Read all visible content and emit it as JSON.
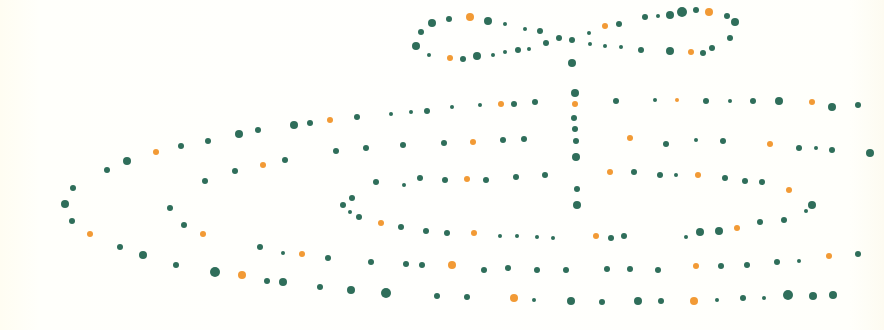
{
  "illustration": {
    "subject": "gift box drawn with dots",
    "background": "#fffef9",
    "colors": {
      "green": "#2f6e5a",
      "orange": "#f29a35"
    },
    "dots": [
      [
        470,
        17,
        4,
        "o"
      ],
      [
        449,
        19,
        3,
        "g"
      ],
      [
        432,
        23,
        4,
        "g"
      ],
      [
        421,
        32,
        3,
        "g"
      ],
      [
        416,
        46,
        4,
        "g"
      ],
      [
        429,
        55,
        2,
        "g"
      ],
      [
        450,
        58,
        3,
        "o"
      ],
      [
        463,
        59,
        3,
        "g"
      ],
      [
        477,
        56,
        4,
        "g"
      ],
      [
        493,
        55,
        2,
        "g"
      ],
      [
        505,
        52,
        2,
        "g"
      ],
      [
        518,
        50,
        3,
        "g"
      ],
      [
        529,
        49,
        2,
        "g"
      ],
      [
        488,
        21,
        4,
        "g"
      ],
      [
        505,
        24,
        2,
        "g"
      ],
      [
        525,
        29,
        2,
        "g"
      ],
      [
        540,
        31,
        3,
        "g"
      ],
      [
        546,
        43,
        3,
        "g"
      ],
      [
        559,
        38,
        3,
        "g"
      ],
      [
        572,
        40,
        3,
        "g"
      ],
      [
        572,
        63,
        4,
        "g"
      ],
      [
        590,
        44,
        2,
        "g"
      ],
      [
        605,
        46,
        2,
        "g"
      ],
      [
        621,
        47,
        2,
        "g"
      ],
      [
        641,
        50,
        3,
        "g"
      ],
      [
        670,
        51,
        4,
        "g"
      ],
      [
        691,
        52,
        3,
        "o"
      ],
      [
        703,
        53,
        3,
        "g"
      ],
      [
        712,
        48,
        3,
        "g"
      ],
      [
        730,
        38,
        3,
        "g"
      ],
      [
        735,
        22,
        4,
        "g"
      ],
      [
        727,
        16,
        3,
        "g"
      ],
      [
        709,
        12,
        4,
        "o"
      ],
      [
        696,
        10,
        3,
        "g"
      ],
      [
        682,
        12,
        5,
        "g"
      ],
      [
        670,
        15,
        4,
        "g"
      ],
      [
        658,
        16,
        2,
        "g"
      ],
      [
        645,
        17,
        3,
        "g"
      ],
      [
        619,
        24,
        3,
        "g"
      ],
      [
        605,
        26,
        3,
        "o"
      ],
      [
        589,
        33,
        2,
        "g"
      ],
      [
        73,
        188,
        3,
        "g"
      ],
      [
        65,
        204,
        4,
        "g"
      ],
      [
        72,
        221,
        3,
        "g"
      ],
      [
        90,
        234,
        3,
        "o"
      ],
      [
        107,
        170,
        3,
        "g"
      ],
      [
        127,
        161,
        4,
        "g"
      ],
      [
        156,
        152,
        3,
        "o"
      ],
      [
        181,
        146,
        3,
        "g"
      ],
      [
        208,
        141,
        3,
        "g"
      ],
      [
        239,
        134,
        4,
        "g"
      ],
      [
        258,
        130,
        3,
        "g"
      ],
      [
        294,
        125,
        4,
        "g"
      ],
      [
        310,
        123,
        3,
        "g"
      ],
      [
        330,
        120,
        3,
        "o"
      ],
      [
        357,
        117,
        3,
        "g"
      ],
      [
        391,
        114,
        2,
        "g"
      ],
      [
        411,
        112,
        2,
        "g"
      ],
      [
        427,
        111,
        3,
        "g"
      ],
      [
        452,
        107,
        2,
        "g"
      ],
      [
        480,
        105,
        2,
        "g"
      ],
      [
        501,
        104,
        3,
        "o"
      ],
      [
        514,
        104,
        3,
        "g"
      ],
      [
        535,
        102,
        3,
        "g"
      ],
      [
        120,
        247,
        3,
        "g"
      ],
      [
        143,
        255,
        4,
        "g"
      ],
      [
        176,
        265,
        3,
        "g"
      ],
      [
        215,
        272,
        5,
        "g"
      ],
      [
        242,
        275,
        4,
        "o"
      ],
      [
        267,
        281,
        3,
        "g"
      ],
      [
        283,
        282,
        4,
        "g"
      ],
      [
        320,
        287,
        3,
        "g"
      ],
      [
        351,
        290,
        4,
        "g"
      ],
      [
        386,
        293,
        5,
        "g"
      ],
      [
        437,
        296,
        3,
        "g"
      ],
      [
        467,
        297,
        3,
        "g"
      ],
      [
        514,
        298,
        4,
        "o"
      ],
      [
        534,
        300,
        2,
        "g"
      ],
      [
        571,
        301,
        4,
        "g"
      ],
      [
        602,
        302,
        3,
        "g"
      ],
      [
        638,
        301,
        4,
        "g"
      ],
      [
        661,
        301,
        3,
        "g"
      ],
      [
        694,
        301,
        4,
        "o"
      ],
      [
        717,
        300,
        2,
        "g"
      ],
      [
        743,
        298,
        3,
        "g"
      ],
      [
        764,
        298,
        2,
        "g"
      ],
      [
        788,
        295,
        5,
        "g"
      ],
      [
        813,
        296,
        4,
        "g"
      ],
      [
        833,
        295,
        4,
        "g"
      ],
      [
        170,
        208,
        3,
        "g"
      ],
      [
        184,
        225,
        3,
        "g"
      ],
      [
        203,
        234,
        3,
        "o"
      ],
      [
        205,
        181,
        3,
        "g"
      ],
      [
        235,
        171,
        3,
        "g"
      ],
      [
        263,
        165,
        3,
        "o"
      ],
      [
        285,
        160,
        3,
        "g"
      ],
      [
        336,
        151,
        3,
        "g"
      ],
      [
        366,
        148,
        3,
        "g"
      ],
      [
        403,
        145,
        3,
        "g"
      ],
      [
        444,
        143,
        3,
        "g"
      ],
      [
        473,
        142,
        3,
        "o"
      ],
      [
        503,
        140,
        3,
        "g"
      ],
      [
        524,
        139,
        3,
        "g"
      ],
      [
        260,
        247,
        3,
        "g"
      ],
      [
        283,
        253,
        2,
        "g"
      ],
      [
        302,
        254,
        3,
        "o"
      ],
      [
        328,
        258,
        3,
        "g"
      ],
      [
        371,
        262,
        3,
        "g"
      ],
      [
        406,
        264,
        3,
        "g"
      ],
      [
        422,
        265,
        3,
        "g"
      ],
      [
        452,
        265,
        4,
        "o"
      ],
      [
        484,
        270,
        3,
        "g"
      ],
      [
        508,
        268,
        3,
        "g"
      ],
      [
        537,
        270,
        3,
        "g"
      ],
      [
        566,
        270,
        3,
        "g"
      ],
      [
        607,
        269,
        3,
        "g"
      ],
      [
        630,
        269,
        3,
        "g"
      ],
      [
        658,
        270,
        3,
        "g"
      ],
      [
        696,
        266,
        3,
        "o"
      ],
      [
        721,
        266,
        3,
        "g"
      ],
      [
        747,
        265,
        3,
        "g"
      ],
      [
        777,
        262,
        3,
        "g"
      ],
      [
        799,
        261,
        2,
        "g"
      ],
      [
        829,
        256,
        3,
        "o"
      ],
      [
        858,
        254,
        3,
        "g"
      ],
      [
        343,
        205,
        3,
        "g"
      ],
      [
        352,
        198,
        3,
        "g"
      ],
      [
        350,
        212,
        2,
        "g"
      ],
      [
        359,
        217,
        3,
        "g"
      ],
      [
        381,
        223,
        3,
        "o"
      ],
      [
        401,
        227,
        3,
        "g"
      ],
      [
        426,
        231,
        3,
        "g"
      ],
      [
        447,
        233,
        3,
        "g"
      ],
      [
        474,
        233,
        3,
        "o"
      ],
      [
        500,
        236,
        2,
        "g"
      ],
      [
        517,
        236,
        2,
        "g"
      ],
      [
        537,
        237,
        2,
        "g"
      ],
      [
        553,
        238,
        2,
        "g"
      ],
      [
        596,
        236,
        3,
        "o"
      ],
      [
        611,
        238,
        3,
        "g"
      ],
      [
        624,
        236,
        3,
        "g"
      ],
      [
        686,
        237,
        2,
        "g"
      ],
      [
        700,
        232,
        4,
        "g"
      ],
      [
        719,
        231,
        4,
        "g"
      ],
      [
        737,
        228,
        3,
        "o"
      ],
      [
        760,
        222,
        3,
        "g"
      ],
      [
        784,
        220,
        3,
        "g"
      ],
      [
        806,
        211,
        2,
        "g"
      ],
      [
        812,
        205,
        4,
        "g"
      ],
      [
        376,
        182,
        3,
        "g"
      ],
      [
        404,
        185,
        2,
        "g"
      ],
      [
        420,
        178,
        3,
        "g"
      ],
      [
        445,
        180,
        3,
        "g"
      ],
      [
        467,
        179,
        3,
        "o"
      ],
      [
        486,
        180,
        3,
        "g"
      ],
      [
        516,
        177,
        3,
        "g"
      ],
      [
        545,
        175,
        3,
        "g"
      ],
      [
        610,
        172,
        3,
        "o"
      ],
      [
        634,
        172,
        3,
        "g"
      ],
      [
        660,
        175,
        3,
        "g"
      ],
      [
        676,
        175,
        2,
        "g"
      ],
      [
        698,
        175,
        3,
        "o"
      ],
      [
        725,
        178,
        3,
        "g"
      ],
      [
        745,
        181,
        3,
        "g"
      ],
      [
        762,
        182,
        3,
        "g"
      ],
      [
        789,
        190,
        3,
        "o"
      ],
      [
        575,
        93,
        4,
        "g"
      ],
      [
        575,
        104,
        3,
        "o"
      ],
      [
        574,
        118,
        3,
        "g"
      ],
      [
        575,
        129,
        3,
        "g"
      ],
      [
        576,
        141,
        3,
        "g"
      ],
      [
        576,
        157,
        4,
        "g"
      ],
      [
        577,
        189,
        3,
        "g"
      ],
      [
        577,
        205,
        4,
        "g"
      ],
      [
        616,
        101,
        3,
        "g"
      ],
      [
        655,
        100,
        2,
        "g"
      ],
      [
        677,
        100,
        2,
        "o"
      ],
      [
        706,
        101,
        3,
        "g"
      ],
      [
        730,
        101,
        2,
        "g"
      ],
      [
        753,
        101,
        3,
        "g"
      ],
      [
        779,
        101,
        4,
        "g"
      ],
      [
        812,
        102,
        3,
        "o"
      ],
      [
        832,
        107,
        4,
        "g"
      ],
      [
        858,
        105,
        3,
        "g"
      ],
      [
        630,
        138,
        3,
        "o"
      ],
      [
        666,
        144,
        3,
        "g"
      ],
      [
        696,
        140,
        2,
        "g"
      ],
      [
        723,
        141,
        3,
        "g"
      ],
      [
        770,
        144,
        3,
        "o"
      ],
      [
        799,
        148,
        3,
        "g"
      ],
      [
        816,
        148,
        2,
        "g"
      ],
      [
        832,
        150,
        3,
        "g"
      ],
      [
        870,
        153,
        4,
        "g"
      ]
    ]
  }
}
